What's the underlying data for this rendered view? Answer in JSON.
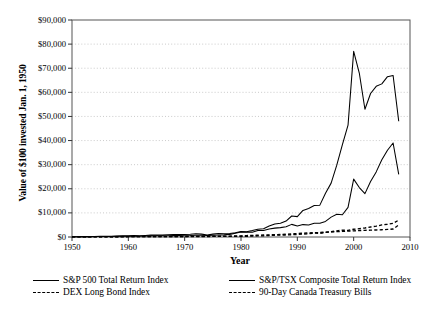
{
  "axes": {
    "ylabel": "Value of $100 invested Jan. 1, 1950",
    "xlabel": "Year",
    "ytick_labels": [
      "$90,000",
      "$80,000",
      "$70,000",
      "$60,000",
      "$50,000",
      "$40,000",
      "$30,000",
      "$20,000",
      "$10,000",
      "$0"
    ],
    "xtick_labels": [
      "1950",
      "1960",
      "1970",
      "1980",
      "1990",
      "2000",
      "2010"
    ]
  },
  "legend": {
    "entries": [
      {
        "label": "S&P 500 Total Return Index",
        "style": "solid"
      },
      {
        "label": "S&P/TSX Composite Total Return Index",
        "style": "solid"
      },
      {
        "label": "DEX Long Bond Index",
        "style": "dashed"
      },
      {
        "label": "90-Day Canada Treasury Bills",
        "style": "dashed"
      }
    ]
  },
  "chart_data": {
    "type": "line",
    "title": "",
    "xlabel": "Year",
    "ylabel": "Value of $100 invested Jan. 1, 1950",
    "xlim": [
      1950,
      2010
    ],
    "ylim": [
      0,
      90000
    ],
    "ytick_values": [
      0,
      10000,
      20000,
      30000,
      40000,
      50000,
      60000,
      70000,
      80000,
      90000
    ],
    "xtick_values": [
      1950,
      1960,
      1970,
      1980,
      1990,
      2000,
      2010
    ],
    "grid": "horizontal-dotted",
    "legend_position": "below-axis",
    "line_color": "#000000",
    "x": [
      1950,
      1951,
      1952,
      1953,
      1954,
      1955,
      1956,
      1957,
      1958,
      1959,
      1960,
      1961,
      1962,
      1963,
      1964,
      1965,
      1966,
      1967,
      1968,
      1969,
      1970,
      1971,
      1972,
      1973,
      1974,
      1975,
      1976,
      1977,
      1978,
      1979,
      1980,
      1981,
      1982,
      1983,
      1984,
      1985,
      1986,
      1987,
      1988,
      1989,
      1990,
      1991,
      1992,
      1993,
      1994,
      1995,
      1996,
      1997,
      1998,
      1999,
      2000,
      2001,
      2002,
      2003,
      2004,
      2005,
      2006,
      2007,
      2008
    ],
    "series": [
      {
        "name": "S&P 500 Total Return Index",
        "style": "solid",
        "values": [
          100,
          130,
          150,
          150,
          225,
          300,
          320,
          290,
          415,
          465,
          465,
          590,
          545,
          665,
          775,
          870,
          785,
          970,
          1075,
          990,
          1025,
          1170,
          1390,
          1185,
          870,
          1195,
          1480,
          1375,
          1465,
          1735,
          2295,
          2185,
          2655,
          3250,
          3455,
          4550,
          5395,
          5680,
          6620,
          8715,
          8445,
          11010,
          11850,
          13040,
          13210,
          18175,
          22345,
          29800,
          38320,
          46375,
          77000,
          68000,
          53000,
          59500,
          62500,
          63500,
          66500,
          67000,
          48000
        ]
      },
      {
        "name": "S&P/TSX Composite Total Return Index",
        "style": "solid",
        "values": [
          100,
          125,
          130,
          125,
          170,
          235,
          250,
          215,
          275,
          290,
          280,
          360,
          340,
          400,
          465,
          500,
          475,
          525,
          585,
          580,
          555,
          600,
          740,
          760,
          665,
          740,
          830,
          880,
          1090,
          1575,
          2075,
          1940,
          2020,
          2735,
          2665,
          3360,
          3680,
          3880,
          4270,
          5240,
          4600,
          5140,
          5000,
          5700,
          5680,
          6470,
          8240,
          9400,
          9250,
          12300,
          24000,
          20500,
          18000,
          23000,
          27000,
          32000,
          36000,
          39000,
          26000
        ]
      },
      {
        "name": "DEX Long Bond Index",
        "style": "dashed",
        "values": [
          100,
          100,
          102,
          105,
          112,
          113,
          112,
          118,
          120,
          118,
          128,
          134,
          138,
          142,
          148,
          150,
          150,
          152,
          160,
          155,
          185,
          205,
          215,
          220,
          215,
          235,
          275,
          290,
          290,
          285,
          285,
          280,
          400,
          435,
          500,
          640,
          740,
          760,
          830,
          940,
          1010,
          1230,
          1350,
          1620,
          1520,
          1890,
          2180,
          2540,
          2850,
          2750,
          3200,
          3450,
          3750,
          4150,
          4500,
          5000,
          5300,
          5700,
          7000
        ]
      },
      {
        "name": "90-Day Canada Treasury Bills",
        "style": "dashed",
        "values": [
          100,
          101,
          103,
          106,
          108,
          110,
          113,
          118,
          122,
          128,
          134,
          139,
          145,
          152,
          158,
          166,
          175,
          183,
          194,
          208,
          222,
          234,
          244,
          261,
          284,
          307,
          336,
          362,
          393,
          440,
          494,
          582,
          676,
          742,
          825,
          895,
          970,
          1050,
          1150,
          1280,
          1440,
          1580,
          1680,
          1770,
          1870,
          2010,
          2110,
          2200,
          2310,
          2420,
          2560,
          2680,
          2760,
          2840,
          2910,
          3010,
          3140,
          3300,
          5000
        ]
      }
    ]
  }
}
